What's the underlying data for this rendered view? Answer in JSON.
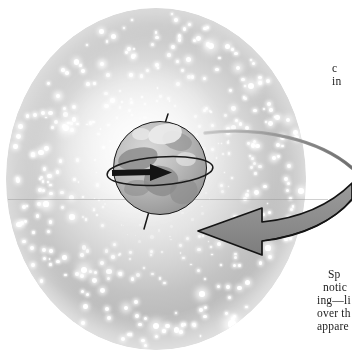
{
  "figure": {
    "colors": {
      "page_background": "#ffffff",
      "starfield_light": "#f5f5f5",
      "starfield_mid": "#d2d2d2",
      "starfield_dark": "#bcbcbc",
      "star": "#ffffff",
      "planet_light": "#d8d8d8",
      "planet_mid": "#a7a7a7",
      "planet_dark": "#8a8a8a",
      "arrow_fill": "#8e8e8e",
      "arrow_stroke": "#141414",
      "axis_stroke": "#161616",
      "text": "#1d1d1d"
    }
  },
  "starfield": {
    "label": "star-field-sphere",
    "center_x": 156,
    "center_y": 179,
    "radius_x": 150,
    "radius_y": 171
  },
  "planet": {
    "label": "planet-earth",
    "center_x": 160,
    "center_y": 168,
    "radius": 47,
    "axis_tilt_degrees": 18
  },
  "arrows": {
    "rotation_arrow": {
      "label": "planet-rotation-arrow",
      "direction": "eastward",
      "description": "small straight arrow across planet equator pointing right"
    },
    "equator_loop": {
      "label": "planet-equator-loop",
      "description": "thin ellipse encircling planet at equator"
    },
    "sky_arrow": {
      "label": "celestial-sphere-rotation-arrow",
      "direction": "westward",
      "description": "large curved block arrow sweeping from right around toward the planet"
    }
  },
  "text": {
    "top_fragment": {
      "label": "clipped-paragraph-top",
      "lines": [
        "c",
        "in"
      ]
    },
    "bottom_fragment": {
      "label": "clipped-paragraph-bottom",
      "lines": [
        "Sp",
        "notic",
        "ing—li",
        "over th",
        "appare"
      ]
    }
  }
}
